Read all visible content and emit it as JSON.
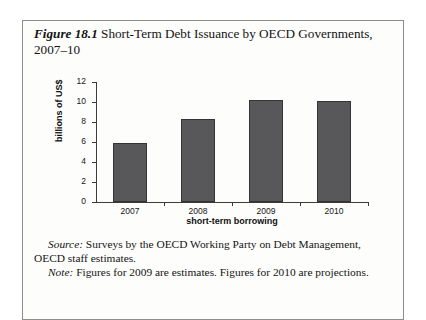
{
  "caption": {
    "figure_number": "Figure 18.1",
    "title": " Short-Term Debt Issuance by OECD Governments, 2007–10"
  },
  "chart_data": {
    "type": "bar",
    "title": "Short-Term Debt Issuance by OECD Governments, 2007–10",
    "categories": [
      "2007",
      "2008",
      "2009",
      "2010"
    ],
    "values": [
      5.9,
      8.3,
      10.2,
      10.1
    ],
    "xlabel": "short-term borrowing",
    "ylabel": "billions of US$",
    "ylim": [
      0,
      12
    ],
    "yticks": [
      "0",
      "2",
      "4",
      "6",
      "8",
      "10",
      "12"
    ],
    "grid": false,
    "legend": "none",
    "bar_color": "#58585a",
    "bar_border_color": "#343436",
    "axis_color": "#3b3b3b"
  },
  "notes": {
    "source_label": "Source:",
    "source_text": " Surveys by the OECD Working Party on Debt Management, OECD staff estimates.",
    "note_label": "Note:",
    "note_text": " Figures for 2009 are estimates. Figures for 2010 are projections."
  }
}
